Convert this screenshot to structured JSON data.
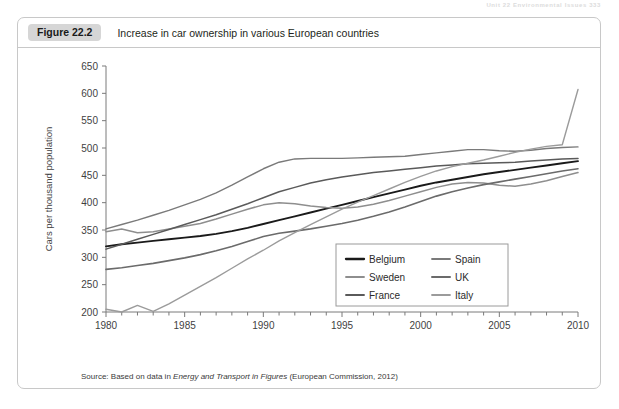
{
  "running_header": "Unit 22  Environmental Issues  333",
  "figure": {
    "badge": "Figure 22.2",
    "title": "Increase in car ownership in various European countries"
  },
  "source": {
    "prefix": "Source: Based on data in ",
    "italic": "Energy and Transport in Figures",
    "suffix": " (European Commission, 2012)"
  },
  "legend": {
    "entries": [
      {
        "label": "Belgium",
        "color": "#1a1a1a",
        "width": 1.9
      },
      {
        "label": "Sweden",
        "color": "#8e8e8e",
        "width": 1.5
      },
      {
        "label": "France",
        "color": "#5a5a5a",
        "width": 1.5
      },
      {
        "label": "Spain",
        "color": "#7a7a7a",
        "width": 1.4
      },
      {
        "label": "UK",
        "color": "#6b6b6b",
        "width": 1.6
      },
      {
        "label": "Italy",
        "color": "#9b9b9b",
        "width": 1.4
      }
    ]
  },
  "chart_data": {
    "type": "line",
    "title": "Increase in car ownership in various European countries",
    "xlabel": "",
    "ylabel": "Cars per thousand population",
    "xlim": [
      1980,
      2010
    ],
    "ylim": [
      200,
      650
    ],
    "ytick_step": 50,
    "yticks": [
      200,
      250,
      300,
      350,
      400,
      450,
      500,
      550,
      600,
      650
    ],
    "xticks_major": [
      1980,
      1985,
      1990,
      1995,
      2000,
      2005,
      2010
    ],
    "xtick_minor_step": 1,
    "grid": false,
    "legend_position": "inside-lower-right",
    "x": [
      1980,
      1981,
      1982,
      1983,
      1984,
      1985,
      1986,
      1987,
      1988,
      1989,
      1990,
      1991,
      1992,
      1993,
      1994,
      1995,
      1996,
      1997,
      1998,
      1999,
      2000,
      2001,
      2002,
      2003,
      2004,
      2005,
      2006,
      2007,
      2008,
      2009,
      2010
    ],
    "series": [
      {
        "name": "Belgium",
        "color": "#1a1a1a",
        "values": [
          320,
          324,
          327,
          330,
          333,
          336,
          339,
          343,
          348,
          354,
          361,
          368,
          375,
          382,
          389,
          396,
          403,
          410,
          417,
          424,
          431,
          437,
          442,
          447,
          452,
          456,
          460,
          464,
          468,
          472,
          476
        ]
      },
      {
        "name": "Sweden",
        "color": "#8e8e8e",
        "values": [
          347,
          352,
          345,
          347,
          352,
          357,
          362,
          370,
          379,
          388,
          396,
          400,
          398,
          394,
          391,
          390,
          392,
          397,
          404,
          412,
          420,
          428,
          434,
          437,
          436,
          432,
          430,
          434,
          440,
          448,
          455
        ]
      },
      {
        "name": "France",
        "color": "#5a5a5a",
        "values": [
          315,
          324,
          333,
          342,
          351,
          360,
          369,
          378,
          388,
          398,
          409,
          420,
          428,
          436,
          442,
          447,
          451,
          455,
          458,
          461,
          464,
          467,
          469,
          471,
          472,
          473,
          474,
          476,
          478,
          480,
          481
        ]
      },
      {
        "name": "Spain",
        "color": "#7a7a7a",
        "values": [
          352,
          360,
          368,
          377,
          386,
          396,
          406,
          418,
          432,
          447,
          462,
          474,
          480,
          481,
          481,
          481,
          482,
          483,
          484,
          485,
          488,
          491,
          494,
          497,
          497,
          495,
          494,
          496,
          499,
          501,
          502
        ]
      },
      {
        "name": "UK",
        "color": "#6b6b6b",
        "values": [
          278,
          281,
          285,
          289,
          294,
          299,
          305,
          312,
          320,
          329,
          338,
          344,
          348,
          352,
          357,
          362,
          368,
          375,
          383,
          392,
          402,
          412,
          420,
          427,
          433,
          438,
          443,
          448,
          453,
          458,
          462
        ]
      },
      {
        "name": "Italy",
        "color": "#9b9b9b",
        "values": [
          205,
          200,
          212,
          201,
          215,
          231,
          247,
          263,
          280,
          297,
          313,
          330,
          345,
          360,
          374,
          388,
          401,
          413,
          425,
          437,
          448,
          458,
          466,
          472,
          478,
          485,
          492,
          498,
          503,
          506,
          607
        ]
      }
    ]
  }
}
